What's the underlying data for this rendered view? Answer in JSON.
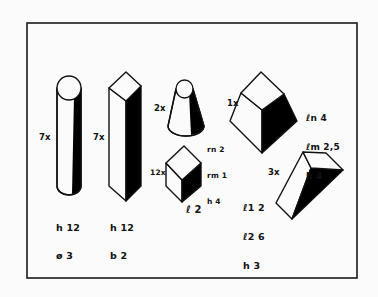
{
  "diagram": {
    "frame": {
      "x": 27,
      "y": 22,
      "w": 330,
      "h": 256,
      "stroke": "#1a1a1a",
      "background": "#fbfbfb"
    },
    "shapes": [
      {
        "id": "cylinder",
        "name": "Cylinder",
        "count_label": "7x",
        "dims": [
          "h 12",
          "ø 3"
        ]
      },
      {
        "id": "square-prism",
        "name": "Square prism",
        "count_label": "7x",
        "dims": [
          "h 12",
          "b 2"
        ]
      },
      {
        "id": "truncated-cone",
        "name": "Truncated cone",
        "count_label": "2x",
        "dims": [
          "rn 2",
          "rm 1",
          "h 4"
        ]
      },
      {
        "id": "cube",
        "name": "Cube",
        "count_label": "12x",
        "dims": [
          "ℓ 2"
        ]
      },
      {
        "id": "truncated-pyramid",
        "name": "Truncated pyramid",
        "count_label": "1x",
        "dims": [
          "ℓn 4",
          "ℓm 2,5",
          "h 4"
        ]
      },
      {
        "id": "wedge",
        "name": "Wedge prism",
        "count_label": "3x",
        "dims": [
          "ℓ1 2",
          "ℓ2 6",
          "h 3"
        ]
      }
    ],
    "colors": {
      "ink": "#111111",
      "paper": "#fbfbfb",
      "shadow": "#000000"
    }
  }
}
